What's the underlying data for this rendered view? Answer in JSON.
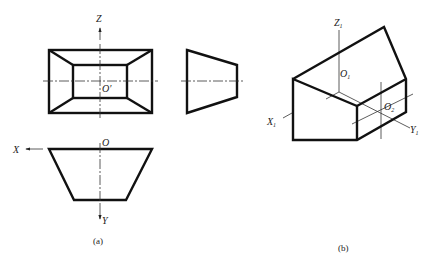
{
  "figure": {
    "panel_a": {
      "caption": "(a)",
      "front_view": {
        "axis_label_vertical": "Z",
        "origin_label": "O′"
      },
      "top_view": {
        "axis_label_horizontal": "X",
        "axis_label_vertical": "Y",
        "origin_label": "O"
      },
      "side_view": {}
    },
    "panel_b": {
      "caption": "(b)",
      "axes": {
        "x_label": "X",
        "x_sub": "1",
        "y_label": "Y",
        "y_sub": "1",
        "z_label": "Z",
        "z_sub": "1"
      },
      "origins": [
        {
          "label": "O",
          "sub": "1"
        },
        {
          "label": "O",
          "sub": "2"
        }
      ]
    },
    "colors": {
      "line": "#111111",
      "background": "#ffffff"
    }
  }
}
